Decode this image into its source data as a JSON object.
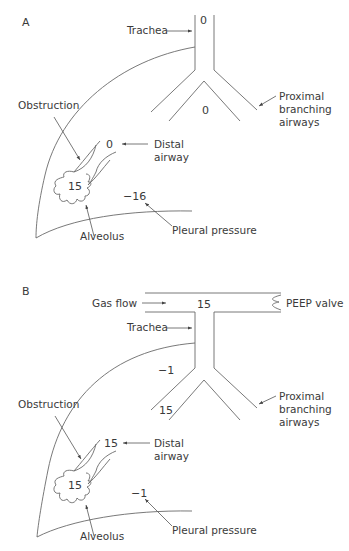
{
  "panelA": {
    "label": "A",
    "labels": {
      "trachea": "Trachea",
      "proximal1": "Proximal",
      "proximal2": "branching",
      "proximal3": "airways",
      "obstruction": "Obstruction",
      "distal1": "Distal",
      "distal2": "airway",
      "alveolus": "Alveolus",
      "pleural": "Pleural pressure"
    },
    "values": {
      "trachea": "0",
      "proximal": "0",
      "distal": "0",
      "alveolus": "15",
      "pleural": "−16"
    }
  },
  "panelB": {
    "label": "B",
    "labels": {
      "gasflow": "Gas flow",
      "peep": "PEEP valve",
      "trachea": "Trachea",
      "proximal1": "Proximal",
      "proximal2": "branching",
      "proximal3": "airways",
      "obstruction": "Obstruction",
      "distal1": "Distal",
      "distal2": "airway",
      "alveolus": "Alveolus",
      "pleural": "Pleural pressure"
    },
    "values": {
      "circuit": "15",
      "trachea": "−1",
      "proximal": "15",
      "distal": "15",
      "alveolus": "15",
      "pleural": "−1"
    }
  }
}
